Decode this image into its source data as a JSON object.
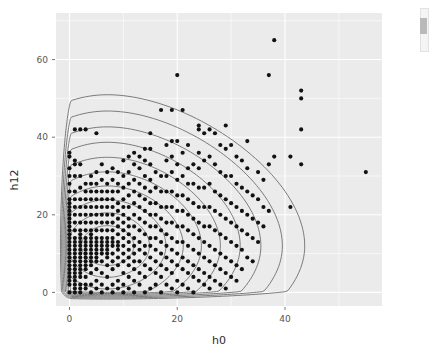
{
  "figure": {
    "panel_background": "#ebebeb",
    "point_color": "#111111",
    "contour_color": "#6e6e6e",
    "grid_color": "#ffffff",
    "panel": {
      "left": 56,
      "top": 13,
      "right": 382,
      "bottom": 306
    }
  },
  "scrollbar": {
    "name": "vertical-scrollbar",
    "visible": true
  },
  "chart_data": {
    "type": "scatter",
    "title": "",
    "subtitle": "",
    "xlabel": "h0",
    "ylabel": "h12",
    "xlim": [
      -2.5,
      58
    ],
    "ylim": [
      -3.5,
      72
    ],
    "xticks": [
      0,
      20,
      40
    ],
    "yticks": [
      0,
      20,
      40,
      60
    ],
    "xtick_labels": [
      "0",
      "20",
      "40"
    ],
    "ytick_labels": [
      "0",
      "20",
      "40",
      "60"
    ],
    "grid": true,
    "legend": "none",
    "point_size": 3.0,
    "contour_levels": 10,
    "contour_center": [
      7,
      12
    ],
    "annotations": [],
    "points": [
      [
        0,
        0
      ],
      [
        0,
        2
      ],
      [
        0,
        3
      ],
      [
        0,
        4
      ],
      [
        0,
        5
      ],
      [
        0,
        6
      ],
      [
        0,
        7
      ],
      [
        0,
        8
      ],
      [
        0,
        9
      ],
      [
        0,
        10
      ],
      [
        0,
        11
      ],
      [
        0,
        12
      ],
      [
        0,
        13
      ],
      [
        0,
        14
      ],
      [
        0,
        15
      ],
      [
        0,
        16
      ],
      [
        0,
        17
      ],
      [
        0,
        18
      ],
      [
        0,
        19
      ],
      [
        0,
        20
      ],
      [
        0,
        21
      ],
      [
        0,
        22
      ],
      [
        0,
        23
      ],
      [
        0,
        24
      ],
      [
        0,
        26
      ],
      [
        0,
        28
      ],
      [
        0,
        30
      ],
      [
        0,
        32
      ],
      [
        0,
        35
      ],
      [
        0,
        36
      ],
      [
        1,
        0
      ],
      [
        1,
        1
      ],
      [
        1,
        2
      ],
      [
        1,
        3
      ],
      [
        1,
        4
      ],
      [
        1,
        5
      ],
      [
        1,
        6
      ],
      [
        1,
        7
      ],
      [
        1,
        8
      ],
      [
        1,
        9
      ],
      [
        1,
        10
      ],
      [
        1,
        11
      ],
      [
        1,
        12
      ],
      [
        1,
        13
      ],
      [
        1,
        14
      ],
      [
        1,
        16
      ],
      [
        1,
        18
      ],
      [
        1,
        20
      ],
      [
        1,
        22
      ],
      [
        1,
        24
      ],
      [
        1,
        26
      ],
      [
        1,
        30
      ],
      [
        1,
        33
      ],
      [
        1,
        34
      ],
      [
        1,
        42
      ],
      [
        2,
        0
      ],
      [
        2,
        1
      ],
      [
        2,
        2
      ],
      [
        2,
        4
      ],
      [
        2,
        5
      ],
      [
        2,
        6
      ],
      [
        2,
        7
      ],
      [
        2,
        8
      ],
      [
        2,
        9
      ],
      [
        2,
        10
      ],
      [
        2,
        11
      ],
      [
        2,
        12
      ],
      [
        2,
        13
      ],
      [
        2,
        14
      ],
      [
        2,
        15
      ],
      [
        2,
        16
      ],
      [
        2,
        18
      ],
      [
        2,
        20
      ],
      [
        2,
        22
      ],
      [
        2,
        24
      ],
      [
        2,
        27
      ],
      [
        2,
        30
      ],
      [
        2,
        33
      ],
      [
        2,
        42
      ],
      [
        3,
        1
      ],
      [
        3,
        2
      ],
      [
        3,
        4
      ],
      [
        3,
        6
      ],
      [
        3,
        7
      ],
      [
        3,
        8
      ],
      [
        3,
        9
      ],
      [
        3,
        10
      ],
      [
        3,
        11
      ],
      [
        3,
        12
      ],
      [
        3,
        13
      ],
      [
        3,
        14
      ],
      [
        3,
        16
      ],
      [
        3,
        18
      ],
      [
        3,
        20
      ],
      [
        3,
        22
      ],
      [
        3,
        24
      ],
      [
        3,
        26
      ],
      [
        3,
        28
      ],
      [
        3,
        42
      ],
      [
        4,
        0
      ],
      [
        4,
        2
      ],
      [
        4,
        5
      ],
      [
        4,
        7
      ],
      [
        4,
        8
      ],
      [
        4,
        9
      ],
      [
        4,
        10
      ],
      [
        4,
        11
      ],
      [
        4,
        12
      ],
      [
        4,
        13
      ],
      [
        4,
        14
      ],
      [
        4,
        15
      ],
      [
        4,
        16
      ],
      [
        4,
        18
      ],
      [
        4,
        20
      ],
      [
        4,
        22
      ],
      [
        4,
        24
      ],
      [
        4,
        26
      ],
      [
        4,
        28
      ],
      [
        4,
        30
      ],
      [
        5,
        1
      ],
      [
        5,
        3
      ],
      [
        5,
        6
      ],
      [
        5,
        8
      ],
      [
        5,
        9
      ],
      [
        5,
        10
      ],
      [
        5,
        11
      ],
      [
        5,
        12
      ],
      [
        5,
        13
      ],
      [
        5,
        14
      ],
      [
        5,
        16
      ],
      [
        5,
        18
      ],
      [
        5,
        20
      ],
      [
        5,
        22
      ],
      [
        5,
        24
      ],
      [
        5,
        26
      ],
      [
        5,
        28
      ],
      [
        5,
        31
      ],
      [
        5,
        41
      ],
      [
        6,
        0
      ],
      [
        6,
        2
      ],
      [
        6,
        5
      ],
      [
        6,
        8
      ],
      [
        6,
        10
      ],
      [
        6,
        11
      ],
      [
        6,
        12
      ],
      [
        6,
        13
      ],
      [
        6,
        14
      ],
      [
        6,
        16
      ],
      [
        6,
        18
      ],
      [
        6,
        20
      ],
      [
        6,
        22
      ],
      [
        6,
        24
      ],
      [
        6,
        26
      ],
      [
        6,
        29
      ],
      [
        6,
        33
      ],
      [
        7,
        1
      ],
      [
        7,
        4
      ],
      [
        7,
        7
      ],
      [
        7,
        9
      ],
      [
        7,
        10
      ],
      [
        7,
        11
      ],
      [
        7,
        12
      ],
      [
        7,
        13
      ],
      [
        7,
        14
      ],
      [
        7,
        16
      ],
      [
        7,
        18
      ],
      [
        7,
        20
      ],
      [
        7,
        22
      ],
      [
        7,
        24
      ],
      [
        7,
        26
      ],
      [
        7,
        28
      ],
      [
        7,
        31
      ],
      [
        8,
        0
      ],
      [
        8,
        2
      ],
      [
        8,
        6
      ],
      [
        8,
        8
      ],
      [
        8,
        10
      ],
      [
        8,
        12
      ],
      [
        8,
        13
      ],
      [
        8,
        14
      ],
      [
        8,
        16
      ],
      [
        8,
        18
      ],
      [
        8,
        20
      ],
      [
        8,
        22
      ],
      [
        8,
        24
      ],
      [
        8,
        26
      ],
      [
        8,
        29
      ],
      [
        8,
        32
      ],
      [
        9,
        1
      ],
      [
        9,
        3
      ],
      [
        9,
        7
      ],
      [
        9,
        9
      ],
      [
        9,
        11
      ],
      [
        9,
        12
      ],
      [
        9,
        13
      ],
      [
        9,
        15
      ],
      [
        9,
        17
      ],
      [
        9,
        19
      ],
      [
        9,
        21
      ],
      [
        9,
        23
      ],
      [
        9,
        26
      ],
      [
        9,
        28
      ],
      [
        9,
        31
      ],
      [
        10,
        0
      ],
      [
        10,
        2
      ],
      [
        10,
        5
      ],
      [
        10,
        8
      ],
      [
        10,
        10
      ],
      [
        10,
        12
      ],
      [
        10,
        14
      ],
      [
        10,
        16
      ],
      [
        10,
        18
      ],
      [
        10,
        20
      ],
      [
        10,
        22
      ],
      [
        10,
        24
      ],
      [
        10,
        27
      ],
      [
        10,
        30
      ],
      [
        10,
        34
      ],
      [
        11,
        1
      ],
      [
        11,
        4
      ],
      [
        11,
        7
      ],
      [
        11,
        9
      ],
      [
        11,
        11
      ],
      [
        11,
        13
      ],
      [
        11,
        15
      ],
      [
        11,
        17
      ],
      [
        11,
        19
      ],
      [
        11,
        22
      ],
      [
        11,
        25
      ],
      [
        11,
        28
      ],
      [
        11,
        31
      ],
      [
        11,
        35
      ],
      [
        12,
        0
      ],
      [
        12,
        3
      ],
      [
        12,
        6
      ],
      [
        12,
        8
      ],
      [
        12,
        10
      ],
      [
        12,
        12
      ],
      [
        12,
        14
      ],
      [
        12,
        17
      ],
      [
        12,
        20
      ],
      [
        12,
        23
      ],
      [
        12,
        26
      ],
      [
        12,
        29
      ],
      [
        12,
        33
      ],
      [
        12,
        36
      ],
      [
        13,
        2
      ],
      [
        13,
        5
      ],
      [
        13,
        8
      ],
      [
        13,
        11
      ],
      [
        13,
        13
      ],
      [
        13,
        16
      ],
      [
        13,
        19
      ],
      [
        13,
        22
      ],
      [
        13,
        25
      ],
      [
        13,
        28
      ],
      [
        13,
        32
      ],
      [
        13,
        35
      ],
      [
        14,
        0
      ],
      [
        14,
        4
      ],
      [
        14,
        7
      ],
      [
        14,
        10
      ],
      [
        14,
        12
      ],
      [
        14,
        15
      ],
      [
        14,
        18
      ],
      [
        14,
        21
      ],
      [
        14,
        24
      ],
      [
        14,
        27
      ],
      [
        14,
        30
      ],
      [
        14,
        34
      ],
      [
        14,
        37
      ],
      [
        15,
        1
      ],
      [
        15,
        6
      ],
      [
        15,
        9
      ],
      [
        15,
        12
      ],
      [
        15,
        14
      ],
      [
        15,
        17
      ],
      [
        15,
        20
      ],
      [
        15,
        23
      ],
      [
        15,
        26
      ],
      [
        15,
        29
      ],
      [
        15,
        33
      ],
      [
        15,
        37
      ],
      [
        15,
        41
      ],
      [
        16,
        2
      ],
      [
        16,
        5
      ],
      [
        16,
        8
      ],
      [
        16,
        11
      ],
      [
        16,
        14
      ],
      [
        16,
        17
      ],
      [
        16,
        20
      ],
      [
        16,
        23
      ],
      [
        16,
        27
      ],
      [
        16,
        31
      ],
      [
        17,
        0
      ],
      [
        17,
        4
      ],
      [
        17,
        7
      ],
      [
        17,
        10
      ],
      [
        17,
        13
      ],
      [
        17,
        16
      ],
      [
        17,
        19
      ],
      [
        17,
        22
      ],
      [
        17,
        26
      ],
      [
        17,
        30
      ],
      [
        17,
        47
      ],
      [
        18,
        2
      ],
      [
        18,
        6
      ],
      [
        18,
        9
      ],
      [
        18,
        12
      ],
      [
        18,
        15
      ],
      [
        18,
        18
      ],
      [
        18,
        22
      ],
      [
        18,
        26
      ],
      [
        18,
        30
      ],
      [
        18,
        34
      ],
      [
        18,
        38
      ],
      [
        19,
        1
      ],
      [
        19,
        5
      ],
      [
        19,
        8
      ],
      [
        19,
        11
      ],
      [
        19,
        14
      ],
      [
        19,
        18
      ],
      [
        19,
        22
      ],
      [
        19,
        26
      ],
      [
        19,
        31
      ],
      [
        19,
        35
      ],
      [
        19,
        39
      ],
      [
        19,
        47
      ],
      [
        20,
        0
      ],
      [
        20,
        3
      ],
      [
        20,
        7
      ],
      [
        20,
        10
      ],
      [
        20,
        13
      ],
      [
        20,
        17
      ],
      [
        20,
        21
      ],
      [
        20,
        25
      ],
      [
        20,
        29
      ],
      [
        20,
        33
      ],
      [
        20,
        39
      ],
      [
        20,
        56
      ],
      [
        21,
        2
      ],
      [
        21,
        6
      ],
      [
        21,
        9
      ],
      [
        21,
        13
      ],
      [
        21,
        17
      ],
      [
        21,
        21
      ],
      [
        21,
        25
      ],
      [
        21,
        30
      ],
      [
        21,
        36
      ],
      [
        21,
        47
      ],
      [
        22,
        1
      ],
      [
        22,
        5
      ],
      [
        22,
        8
      ],
      [
        22,
        12
      ],
      [
        22,
        16
      ],
      [
        22,
        20
      ],
      [
        22,
        24
      ],
      [
        22,
        28
      ],
      [
        22,
        32
      ],
      [
        22,
        38
      ],
      [
        23,
        0
      ],
      [
        23,
        4
      ],
      [
        23,
        7
      ],
      [
        23,
        11
      ],
      [
        23,
        15
      ],
      [
        23,
        19
      ],
      [
        23,
        23
      ],
      [
        23,
        28
      ],
      [
        23,
        33
      ],
      [
        24,
        3
      ],
      [
        24,
        6
      ],
      [
        24,
        10
      ],
      [
        24,
        14
      ],
      [
        24,
        18
      ],
      [
        24,
        22
      ],
      [
        24,
        27
      ],
      [
        24,
        32
      ],
      [
        24,
        36
      ],
      [
        24,
        42
      ],
      [
        24,
        43
      ],
      [
        25,
        2
      ],
      [
        25,
        5
      ],
      [
        25,
        9
      ],
      [
        25,
        13
      ],
      [
        25,
        17
      ],
      [
        25,
        22
      ],
      [
        25,
        27
      ],
      [
        25,
        34
      ],
      [
        25,
        41
      ],
      [
        26,
        1
      ],
      [
        26,
        4
      ],
      [
        26,
        8
      ],
      [
        26,
        12
      ],
      [
        26,
        17
      ],
      [
        26,
        22
      ],
      [
        26,
        28
      ],
      [
        26,
        35
      ],
      [
        26,
        42
      ],
      [
        27,
        3
      ],
      [
        27,
        7
      ],
      [
        27,
        11
      ],
      [
        27,
        16
      ],
      [
        27,
        21
      ],
      [
        27,
        26
      ],
      [
        27,
        33
      ],
      [
        27,
        41
      ],
      [
        28,
        2
      ],
      [
        28,
        6
      ],
      [
        28,
        10
      ],
      [
        28,
        15
      ],
      [
        28,
        20
      ],
      [
        28,
        25
      ],
      [
        28,
        31
      ],
      [
        28,
        38
      ],
      [
        29,
        1
      ],
      [
        29,
        5
      ],
      [
        29,
        9
      ],
      [
        29,
        14
      ],
      [
        29,
        19
      ],
      [
        29,
        24
      ],
      [
        29,
        30
      ],
      [
        29,
        37
      ],
      [
        29,
        43
      ],
      [
        30,
        4
      ],
      [
        30,
        8
      ],
      [
        30,
        13
      ],
      [
        30,
        18
      ],
      [
        30,
        23
      ],
      [
        30,
        30
      ],
      [
        30,
        38
      ],
      [
        31,
        3
      ],
      [
        31,
        7
      ],
      [
        31,
        12
      ],
      [
        31,
        17
      ],
      [
        31,
        22
      ],
      [
        31,
        28
      ],
      [
        31,
        35
      ],
      [
        32,
        6
      ],
      [
        32,
        11
      ],
      [
        32,
        16
      ],
      [
        32,
        21
      ],
      [
        32,
        27
      ],
      [
        32,
        34
      ],
      [
        33,
        9
      ],
      [
        33,
        15
      ],
      [
        33,
        20
      ],
      [
        33,
        26
      ],
      [
        33,
        32
      ],
      [
        33,
        39
      ],
      [
        34,
        8
      ],
      [
        34,
        14
      ],
      [
        34,
        19
      ],
      [
        34,
        25
      ],
      [
        35,
        13
      ],
      [
        35,
        18
      ],
      [
        35,
        24
      ],
      [
        35,
        31
      ],
      [
        36,
        17
      ],
      [
        36,
        22
      ],
      [
        36,
        29
      ],
      [
        37,
        21
      ],
      [
        37,
        33
      ],
      [
        37,
        56
      ],
      [
        38,
        35
      ],
      [
        38,
        65
      ],
      [
        41,
        22
      ],
      [
        41,
        35
      ],
      [
        43,
        33
      ],
      [
        43,
        42
      ],
      [
        43,
        50
      ],
      [
        43,
        52
      ],
      [
        55,
        31
      ]
    ]
  }
}
